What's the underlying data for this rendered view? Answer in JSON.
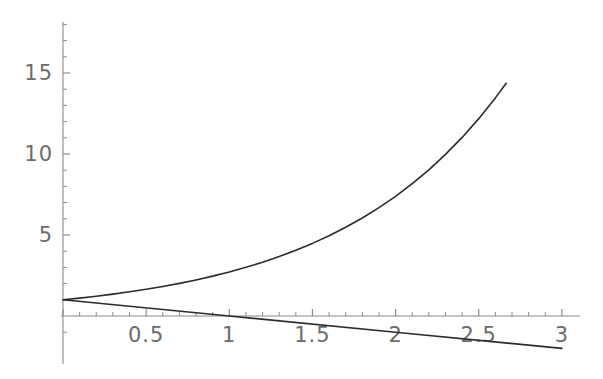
{
  "chart_data": {
    "type": "line",
    "title": "",
    "subtitle": "",
    "xlabel": "",
    "ylabel": "",
    "xlim": [
      0,
      3
    ],
    "ylim": [
      -1.9,
      18
    ],
    "grid": false,
    "legend": "none",
    "style": "mathematica-plot",
    "axis_color": "#8a8a8a",
    "curve_color": "#2b2b2b",
    "tick_label_color": "#6b6b6b",
    "background": "#ffffff",
    "x_ticks_major": [
      {
        "value": 0,
        "label": ""
      },
      {
        "value": 0.5,
        "label": "0.5"
      },
      {
        "value": 1,
        "label": "1"
      },
      {
        "value": 1.5,
        "label": "1.5"
      },
      {
        "value": 2,
        "label": "2"
      },
      {
        "value": 2.5,
        "label": "2.5"
      },
      {
        "value": 3,
        "label": "3"
      }
    ],
    "x_tick_minor_step": 0.1,
    "y_ticks_major": [
      {
        "value": 5,
        "label": "5"
      },
      {
        "value": 10,
        "label": "10"
      },
      {
        "value": 15,
        "label": "15"
      }
    ],
    "y_tick_minor_step": 1,
    "series": [
      {
        "name": "exponential",
        "expression": "E^x",
        "color": "#2b2b2b",
        "x_start": 0,
        "x_end": 2.665,
        "points": [
          [
            0.0,
            1.0
          ],
          [
            0.1,
            1.105
          ],
          [
            0.2,
            1.221
          ],
          [
            0.3,
            1.35
          ],
          [
            0.4,
            1.492
          ],
          [
            0.5,
            1.649
          ],
          [
            0.6,
            1.822
          ],
          [
            0.7,
            2.014
          ],
          [
            0.8,
            2.226
          ],
          [
            0.9,
            2.46
          ],
          [
            1.0,
            2.718
          ],
          [
            1.1,
            3.004
          ],
          [
            1.2,
            3.32
          ],
          [
            1.3,
            3.669
          ],
          [
            1.4,
            4.055
          ],
          [
            1.5,
            4.482
          ],
          [
            1.6,
            4.953
          ],
          [
            1.7,
            5.474
          ],
          [
            1.8,
            6.05
          ],
          [
            1.9,
            6.686
          ],
          [
            2.0,
            7.389
          ],
          [
            2.1,
            8.166
          ],
          [
            2.2,
            9.025
          ],
          [
            2.3,
            9.974
          ],
          [
            2.4,
            11.023
          ],
          [
            2.5,
            12.182
          ],
          [
            2.6,
            13.464
          ],
          [
            2.665,
            14.367
          ]
        ]
      },
      {
        "name": "tangent-line",
        "expression": "1 - x",
        "color": "#2b2b2b",
        "x_start": 0,
        "x_end": 3.0,
        "points": [
          [
            0.0,
            1.0
          ],
          [
            1.0,
            0.0
          ],
          [
            2.0,
            -1.0
          ],
          [
            3.0,
            -2.0
          ]
        ]
      }
    ],
    "annotations": []
  },
  "figure": {
    "name": "plot-figure",
    "width": 603,
    "height": 379
  }
}
